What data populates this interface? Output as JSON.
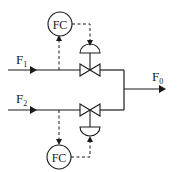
{
  "diagram": {
    "type": "process-control-flow",
    "streams": {
      "inlet_1": {
        "label": "F",
        "subscript": "1"
      },
      "inlet_2": {
        "label": "F",
        "subscript": "2"
      },
      "outlet": {
        "label": "F",
        "subscript": "0"
      }
    },
    "controllers": {
      "top": {
        "label": "FC"
      },
      "bottom": {
        "label": "FC"
      }
    },
    "colors": {
      "line": "#1a1a1a",
      "background": "#ffffff"
    }
  }
}
